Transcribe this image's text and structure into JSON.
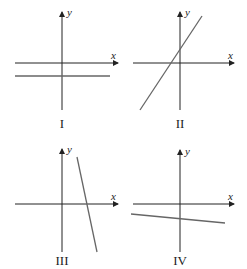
{
  "diagram": {
    "panels": [
      {
        "caption": "I",
        "x_label": "x",
        "y_label": "y",
        "line": "horizontal line below the x-axis (zero slope, negative y-intercept)"
      },
      {
        "caption": "II",
        "x_label": "x",
        "y_label": "y",
        "line": "steep positive slope, positive y-intercept"
      },
      {
        "caption": "III",
        "x_label": "x",
        "y_label": "y",
        "line": "steep negative slope, positive x-intercept"
      },
      {
        "caption": "IV",
        "x_label": "x",
        "y_label": "y",
        "line": "slight negative slope, negative y-intercept"
      }
    ]
  }
}
